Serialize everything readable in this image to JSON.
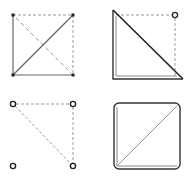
{
  "figure": {
    "colors": {
      "background": "#ffffff",
      "solid_line": "#555555",
      "dark_line": "#222222",
      "dashed_line": "#999999",
      "vertex": "#222222"
    },
    "panels": [
      {
        "id": "panel-1",
        "label": "square-with-diagonals",
        "vertices": [
          [
            13,
            15
          ],
          [
            73,
            15
          ],
          [
            13,
            75
          ],
          [
            73,
            75
          ]
        ],
        "solid_edges": [
          [
            [
              13,
              15
            ],
            [
              13,
              75
            ]
          ],
          [
            [
              13,
              75
            ],
            [
              73,
              75
            ]
          ],
          [
            [
              13,
              75
            ],
            [
              73,
              15
            ]
          ]
        ],
        "dashed_edges": [
          [
            [
              13,
              15
            ],
            [
              73,
              15
            ]
          ],
          [
            [
              73,
              15
            ],
            [
              73,
              75
            ]
          ],
          [
            [
              13,
              15
            ],
            [
              73,
              75
            ]
          ]
        ],
        "vertex_style": "filled-square"
      },
      {
        "id": "panel-2",
        "label": "double-edged-right-triangle",
        "triangle": [
          [
            113,
            10
          ],
          [
            113,
            79
          ],
          [
            183,
            79
          ]
        ],
        "dashed_edges": [
          [
            [
              113,
              15
            ],
            [
              175,
              15
            ]
          ],
          [
            [
              175,
              15
            ],
            [
              175,
              79
            ]
          ]
        ],
        "open_vertex": [
          175,
          15
        ]
      },
      {
        "id": "panel-3",
        "label": "vertices-with-dashed-triangle",
        "vertices": [
          [
            13,
            104
          ],
          [
            73,
            104
          ],
          [
            13,
            166
          ],
          [
            73,
            166
          ]
        ],
        "dashed_edges": [
          [
            [
              13,
              104
            ],
            [
              73,
              104
            ]
          ],
          [
            [
              73,
              104
            ],
            [
              73,
              166
            ]
          ],
          [
            [
              13,
              104
            ],
            [
              73,
              166
            ]
          ]
        ],
        "vertex_style": "open-circle"
      },
      {
        "id": "panel-4",
        "label": "rounded-square-with-diagonal",
        "rect": {
          "x": 114,
          "y": 103,
          "w": 66,
          "h": 66,
          "r": 5
        },
        "diagonal": [
          [
            117,
            166
          ],
          [
            177,
            106
          ]
        ]
      }
    ]
  }
}
